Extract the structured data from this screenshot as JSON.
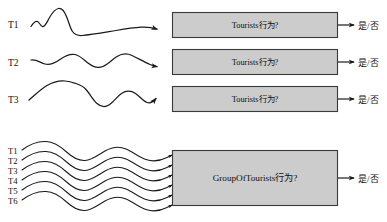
{
  "diagram": {
    "canvas": {
      "width": 387,
      "height": 222,
      "background": "#ffffff"
    },
    "colors": {
      "box_fill": "#cccccc",
      "box_stroke": "#3a3a3a",
      "curve_stroke": "#1a1a1a",
      "text": "#111111"
    },
    "top_group": {
      "name": "individual-tourist-trajectories",
      "series": [
        {
          "label": "T1",
          "box_label": "Tourists行为?",
          "output_label": "是/否"
        },
        {
          "label": "T2",
          "box_label": "Tourists行为?",
          "output_label": "是/否"
        },
        {
          "label": "T3",
          "box_label": "Tourists行为?",
          "output_label": "是/否"
        }
      ]
    },
    "bottom_group": {
      "name": "group-of-tourists-trajectories",
      "series_labels": [
        "T1",
        "T2",
        "T3",
        "T4",
        "T5",
        "T6"
      ],
      "box_label": "GroupOfTourists行为?",
      "output_label": "是/否"
    }
  }
}
